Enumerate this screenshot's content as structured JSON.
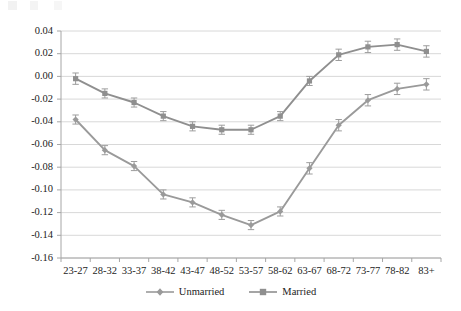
{
  "chart_data": {
    "type": "line",
    "title": "",
    "subtitle": "",
    "xlabel": "",
    "ylabel": "",
    "categories": [
      "23-27",
      "28-32",
      "33-37",
      "38-42",
      "43-47",
      "48-52",
      "53-57",
      "58-62",
      "63-67",
      "68-72",
      "73-77",
      "78-82",
      "83+"
    ],
    "ylim": [
      -0.16,
      0.04
    ],
    "ytick_labels": [
      "0.04",
      "0.02",
      "0.00",
      "-0.02",
      "-0.04",
      "-0.06",
      "-0.08",
      "-0.10",
      "-0.12",
      "-0.14",
      "-0.16"
    ],
    "ytick_values": [
      0.04,
      0.02,
      0.0,
      -0.02,
      -0.04,
      -0.06,
      -0.08,
      -0.1,
      -0.12,
      -0.14,
      -0.16
    ],
    "grid": "horizontal",
    "legend_position": "bottom",
    "error_bars": true,
    "series": [
      {
        "name": "Unmarried",
        "marker": "diamond",
        "color": "#9a9a9a",
        "values": [
          -0.038,
          -0.065,
          -0.079,
          -0.104,
          -0.111,
          -0.122,
          -0.131,
          -0.119,
          -0.081,
          -0.043,
          -0.021,
          -0.011,
          -0.007
        ],
        "errors": [
          0.004,
          0.004,
          0.004,
          0.004,
          0.004,
          0.004,
          0.004,
          0.004,
          0.005,
          0.005,
          0.005,
          0.005,
          0.005
        ]
      },
      {
        "name": "Married",
        "marker": "square",
        "color": "#8f8f8f",
        "values": [
          -0.002,
          -0.015,
          -0.023,
          -0.035,
          -0.044,
          -0.047,
          -0.047,
          -0.035,
          -0.004,
          0.019,
          0.026,
          0.028,
          0.022
        ],
        "errors": [
          0.005,
          0.004,
          0.004,
          0.004,
          0.004,
          0.004,
          0.004,
          0.004,
          0.004,
          0.005,
          0.005,
          0.005,
          0.005
        ]
      }
    ]
  },
  "legend": {
    "items": [
      {
        "label": "Unmarried"
      },
      {
        "label": "Married"
      }
    ]
  },
  "colors": {
    "series_gray": "#9a9a9a",
    "grid": "#d4d4d4",
    "axis": "#a6a6a6",
    "text": "#232323"
  }
}
